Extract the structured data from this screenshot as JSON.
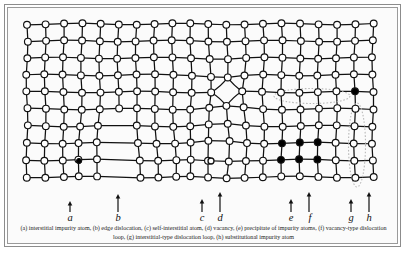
{
  "figure": {
    "caption": "(a) interstitial impurity atom, (b) edge dislocation, (c) self-interstitial atom, (d) vacancy, (e) precipitate of impurity atoms, (f) vacancy-type dislocation loop, (g) interstitial-type dislocation loop, (h) substitutional impurity atom"
  },
  "style": {
    "atom_fill": "#ffffff",
    "atom_stroke": "#111111",
    "impurity_fill": "#000000",
    "bond_color": "#111111",
    "loop_color": "#b9b9b9",
    "frame_color": "#8c8c8c",
    "panel_background": "#fbfbfb"
  },
  "lattice": {
    "columns": 20,
    "rows": 10,
    "atom_radius": 3.4,
    "spacing_x": 18.2,
    "spacing_y": 17.0
  },
  "defects": [
    {
      "key": "a",
      "label": "a",
      "name": "interstitial-impurity-atom",
      "description": "interstitial impurity atom",
      "marker": "filled-small-circle",
      "x": 62,
      "y": 148
    },
    {
      "key": "b",
      "label": "b",
      "name": "edge-dislocation",
      "description": "edge dislocation",
      "marker": "extra-half-plane",
      "x": 105,
      "y": 110
    },
    {
      "key": "c",
      "label": "c",
      "name": "self-interstitial-atom",
      "description": "self-interstitial atom",
      "marker": "small-circle-in-cell",
      "x": 194,
      "y": 148
    },
    {
      "key": "d",
      "label": "d",
      "name": "vacancy",
      "description": "vacancy",
      "marker": "missing-atom",
      "x": 214,
      "y": 82
    },
    {
      "key": "e",
      "label": "e",
      "name": "precipitate-of-impurity-atoms",
      "description": "precipitate of impurity atoms",
      "marker": "filled-atom-cluster",
      "x": 279,
      "y": 140
    },
    {
      "key": "f",
      "label": "f",
      "name": "vacancy-type-dislocation-loop",
      "description": "vacancy-type dislocation loop",
      "marker": "horizontal-dotted-ellipse",
      "x": 295,
      "y": 83
    },
    {
      "key": "g",
      "label": "g",
      "name": "interstitial-type-dislocation-loop",
      "description": "interstitial-type dislocation loop",
      "marker": "vertical-dotted-ellipse",
      "x": 340,
      "y": 132
    },
    {
      "key": "h",
      "label": "h",
      "name": "substitutional-impurity-atom",
      "description": "substitutional impurity atom",
      "marker": "filled-atom-on-site",
      "x": 353,
      "y": 76
    }
  ],
  "pointers": [
    {
      "key": "a",
      "label": "a",
      "x": 53,
      "height": 11,
      "label_x": 46
    },
    {
      "key": "b",
      "label": "b",
      "x": 101,
      "height": 18,
      "label_x": 94
    },
    {
      "key": "c",
      "label": "c",
      "x": 185,
      "height": 13,
      "label_x": 178
    },
    {
      "key": "d",
      "label": "d",
      "x": 203,
      "height": 20,
      "label_x": 196
    },
    {
      "key": "e",
      "label": "e",
      "x": 274,
      "height": 13,
      "label_x": 267
    },
    {
      "key": "f",
      "label": "f",
      "x": 292,
      "height": 20,
      "label_x": 286
    },
    {
      "key": "g",
      "label": "g",
      "x": 334,
      "height": 13,
      "label_x": 327
    },
    {
      "key": "h",
      "label": "h",
      "x": 352,
      "height": 20,
      "label_x": 345
    }
  ]
}
